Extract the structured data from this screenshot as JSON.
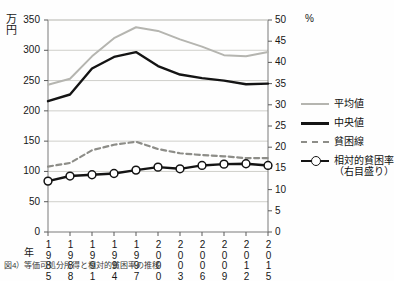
{
  "chart_data": {
    "type": "line",
    "title": "",
    "xlabel": "年",
    "ylabel": "万円",
    "y2label": "%",
    "ylim": [
      0,
      350
    ],
    "y2lim": [
      0,
      50
    ],
    "grid": true,
    "legend_position": "right",
    "categories": [
      "1985",
      "1988",
      "1991",
      "1994",
      "1997",
      "2000",
      "2003",
      "2006",
      "2009",
      "2012",
      "2015"
    ],
    "y_ticks": [
      "0",
      "50",
      "100",
      "150",
      "200",
      "250",
      "300",
      "350"
    ],
    "y2_ticks": [
      "0",
      "5",
      "10",
      "15",
      "20",
      "25",
      "30",
      "35",
      "40",
      "45",
      "50"
    ],
    "series": [
      {
        "name": "平均値",
        "axis": "left",
        "style": "solid",
        "color": "#b5b5b0",
        "marker": "none",
        "values": [
          243,
          253,
          290,
          320,
          338,
          332,
          318,
          306,
          292,
          290,
          297
        ]
      },
      {
        "name": "中央値",
        "axis": "left",
        "style": "solid",
        "color": "#141414",
        "marker": "none",
        "values": [
          216,
          227,
          270,
          289,
          297,
          274,
          260,
          254,
          250,
          244,
          245
        ]
      },
      {
        "name": "貧困線",
        "axis": "left",
        "style": "dashed",
        "color": "#8d8d88",
        "marker": "none",
        "values": [
          108,
          114,
          135,
          144,
          149,
          137,
          130,
          127,
          125,
          122,
          122
        ]
      },
      {
        "name": "相対的貧困率（右目盛り）",
        "axis": "right",
        "style": "solid",
        "color": "#141414",
        "marker": "circle",
        "values": [
          12.0,
          13.2,
          13.5,
          13.8,
          14.6,
          15.3,
          14.9,
          15.7,
          16.0,
          16.1,
          15.7
        ]
      }
    ]
  },
  "legend": {
    "items": [
      {
        "label": "平均値",
        "sub": ""
      },
      {
        "label": "中央値",
        "sub": ""
      },
      {
        "label": "貧困線",
        "sub": ""
      },
      {
        "label": "相対的貧困率",
        "sub": "（右目盛り）"
      }
    ]
  },
  "axes": {
    "left_unit_line1": "万",
    "left_unit_line2": "円",
    "right_unit": "%",
    "x_name": "年"
  },
  "caption": {
    "text": "図4）等価可処分所得と相対的貧困率の推移"
  }
}
